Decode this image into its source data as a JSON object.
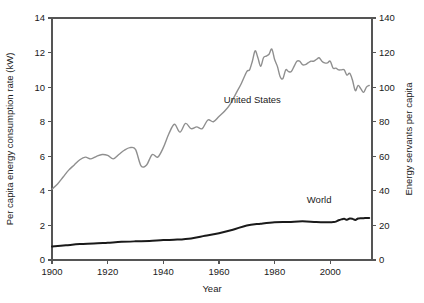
{
  "chart_data": {
    "type": "line",
    "title": "",
    "xlabel": "Year",
    "ylabel": "Per capita energy consumption rate (kW)",
    "y2label": "Energy servants per capita",
    "xlim": [
      1900,
      2015
    ],
    "ylim": [
      0,
      14
    ],
    "y2lim": [
      0,
      140
    ],
    "grid": false,
    "legend_position": "inline-annotations",
    "xticks": [
      1900,
      1920,
      1940,
      1960,
      1980,
      2000
    ],
    "xtick_labels": [
      "1900",
      "1920",
      "1940",
      "1960",
      "1980",
      "2000"
    ],
    "yticks": [
      0,
      2,
      4,
      6,
      8,
      10,
      12,
      14
    ],
    "ytick_labels": [
      "0",
      "2",
      "4",
      "6",
      "8",
      "10",
      "12",
      "14"
    ],
    "y2ticks": [
      0,
      20,
      40,
      60,
      80,
      100,
      120,
      140
    ],
    "y2tick_labels": [
      "0",
      "20",
      "40",
      "60",
      "80",
      "100",
      "120",
      "140"
    ],
    "annotations": [
      {
        "text": "United States",
        "x": 1972,
        "y": 9.1
      },
      {
        "text": "World",
        "x": 1996,
        "y": 3.3
      }
    ],
    "series": [
      {
        "name": "United States",
        "color": "#8f8f8f",
        "width": 1.4,
        "x": [
          1900,
          1902,
          1904,
          1906,
          1908,
          1910,
          1912,
          1914,
          1916,
          1918,
          1920,
          1922,
          1924,
          1926,
          1928,
          1930,
          1932,
          1934,
          1936,
          1938,
          1940,
          1942,
          1944,
          1946,
          1948,
          1950,
          1952,
          1954,
          1956,
          1958,
          1960,
          1962,
          1964,
          1966,
          1968,
          1970,
          1971,
          1972,
          1973,
          1974,
          1975,
          1976,
          1977,
          1978,
          1979,
          1980,
          1981,
          1982,
          1983,
          1984,
          1985,
          1986,
          1987,
          1988,
          1989,
          1990,
          1991,
          1992,
          1993,
          1994,
          1995,
          1996,
          1997,
          1998,
          1999,
          2000,
          2001,
          2002,
          2003,
          2004,
          2005,
          2006,
          2007,
          2008,
          2009,
          2010,
          2011,
          2012,
          2013,
          2014
        ],
        "y": [
          4.1,
          4.4,
          4.8,
          5.2,
          5.5,
          5.8,
          5.95,
          5.85,
          6.0,
          6.1,
          6.05,
          5.85,
          6.1,
          6.35,
          6.5,
          6.4,
          5.45,
          5.5,
          6.1,
          5.95,
          6.5,
          7.3,
          7.85,
          7.4,
          7.9,
          7.6,
          7.7,
          7.6,
          8.1,
          8.0,
          8.3,
          8.6,
          9.0,
          9.6,
          10.2,
          10.9,
          11.0,
          11.5,
          12.1,
          11.7,
          11.2,
          11.7,
          11.8,
          11.9,
          12.2,
          11.6,
          11.2,
          10.6,
          10.5,
          11.0,
          10.9,
          10.9,
          11.2,
          11.5,
          11.5,
          11.3,
          11.3,
          11.4,
          11.5,
          11.5,
          11.6,
          11.7,
          11.5,
          11.4,
          11.4,
          11.5,
          11.1,
          11.1,
          11.0,
          11.0,
          11.0,
          10.7,
          10.8,
          10.4,
          9.8,
          10.1,
          9.9,
          9.7,
          10.0,
          10.1
        ]
      },
      {
        "name": "World",
        "color": "#1a1a1a",
        "width": 2.0,
        "x": [
          1900,
          1905,
          1910,
          1915,
          1920,
          1925,
          1930,
          1935,
          1940,
          1945,
          1950,
          1955,
          1960,
          1965,
          1970,
          1975,
          1980,
          1985,
          1990,
          1995,
          2000,
          2001,
          2002,
          2003,
          2004,
          2005,
          2006,
          2007,
          2008,
          2009,
          2010,
          2011,
          2012,
          2013,
          2014
        ],
        "y": [
          0.78,
          0.85,
          0.92,
          0.95,
          1.0,
          1.05,
          1.08,
          1.1,
          1.15,
          1.18,
          1.25,
          1.4,
          1.55,
          1.75,
          2.0,
          2.1,
          2.18,
          2.2,
          2.24,
          2.2,
          2.18,
          2.2,
          2.22,
          2.3,
          2.35,
          2.38,
          2.33,
          2.4,
          2.38,
          2.32,
          2.4,
          2.42,
          2.42,
          2.43,
          2.43
        ]
      }
    ]
  }
}
